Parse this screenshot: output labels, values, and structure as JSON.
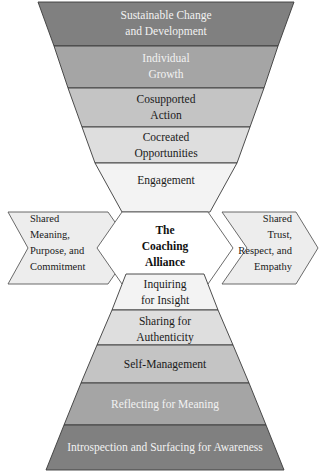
{
  "diagram": {
    "colors": {
      "band_darkest": "#808080",
      "band_dark": "#9a9a9a",
      "band_mid": "#b5b5b5",
      "band_light": "#cfcfcf",
      "band_lightest": "#e8e8e8",
      "band_near_white": "#f4f4f4",
      "alliance_fill": "#ededed",
      "center_fill": "#ffffff",
      "outline": "#3a3a3a",
      "text_dark": "#1a1a1a",
      "text_light": "#f2f2f2"
    },
    "upper_funnel": {
      "name": "inverted-funnel",
      "bands": [
        {
          "id": "sustainable-change",
          "lines": [
            "Sustainable Change",
            "and Development"
          ],
          "fill": "#808080",
          "text_tone": "light"
        },
        {
          "id": "individual-growth",
          "lines": [
            "Individual",
            "Growth"
          ],
          "fill": "#a5a5a5",
          "text_tone": "light"
        },
        {
          "id": "cosupported-action",
          "lines": [
            "Cosupported",
            "Action"
          ],
          "fill": "#c4c4c4",
          "text_tone": "dark"
        },
        {
          "id": "cocreated-opportunities",
          "lines": [
            "Cocreated",
            "Opportunities"
          ],
          "fill": "#dedede",
          "text_tone": "dark"
        },
        {
          "id": "engagement",
          "lines": [
            "Engagement"
          ],
          "fill": "#f3f3f3",
          "text_tone": "dark"
        }
      ]
    },
    "alliance_band": {
      "name": "coaching-alliance-band",
      "left": {
        "id": "shared-meaning",
        "lines": [
          "Shared",
          "Meaning,",
          "Purpose, and",
          "Commitment"
        ],
        "fill": "#ededed"
      },
      "center": {
        "id": "the-coaching-alliance",
        "lines": [
          "The",
          "Coaching",
          "Alliance"
        ],
        "fill": "#ffffff"
      },
      "right": {
        "id": "shared-trust",
        "lines": [
          "Shared",
          "Trust,",
          "Respect, and",
          "Empathy"
        ],
        "fill": "#ededed"
      }
    },
    "lower_pyramid": {
      "name": "upright-pyramid",
      "bands": [
        {
          "id": "inquiring-for-insight",
          "lines": [
            "Inquiring",
            "for Insight"
          ],
          "fill": "#f3f3f3",
          "text_tone": "dark"
        },
        {
          "id": "sharing-for-authenticity",
          "lines": [
            "Sharing for",
            "Authenticity"
          ],
          "fill": "#dedede",
          "text_tone": "dark"
        },
        {
          "id": "self-management",
          "lines": [
            "Self-Management"
          ],
          "fill": "#c4c4c4",
          "text_tone": "dark"
        },
        {
          "id": "reflecting-for-meaning",
          "lines": [
            "Reflecting for Meaning"
          ],
          "fill": "#a5a5a5",
          "text_tone": "light"
        },
        {
          "id": "introspection-and-surfacing",
          "lines": [
            "Introspection and Surfacing for Awareness"
          ],
          "fill": "#808080",
          "text_tone": "light"
        }
      ]
    }
  }
}
